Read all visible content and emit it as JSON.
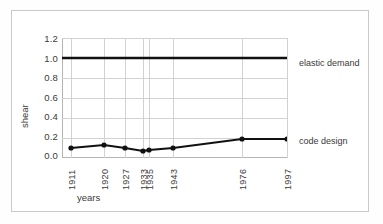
{
  "chart_data": {
    "type": "line",
    "title": "",
    "xlabel": "years",
    "ylabel": "shear",
    "categories": [
      "1911",
      "1920",
      "1927",
      "1933",
      "1935",
      "1943",
      "1976",
      "1997"
    ],
    "ylim": [
      0.0,
      1.3
    ],
    "yticks": [
      "1.2",
      "1.0",
      "0.8",
      "0.6",
      "0.4",
      "0.2",
      "0.0"
    ],
    "ytick_values": [
      1.2,
      1.0,
      0.8,
      0.6,
      0.4,
      0.2,
      0.0
    ],
    "grid": true,
    "legend_position": "right-inline-annotation",
    "series": [
      {
        "name": "elastic demand",
        "values": [
          1.0,
          1.0,
          1.0,
          1.0,
          1.0,
          1.0,
          1.0,
          1.0
        ],
        "markers": false,
        "color": "#111111",
        "label": "elastic demand"
      },
      {
        "name": "code design",
        "values": [
          0.1,
          0.13,
          0.1,
          0.07,
          0.08,
          0.1,
          0.19,
          0.19
        ],
        "markers": true,
        "color": "#111111",
        "label": "code design"
      }
    ],
    "annotations": [
      {
        "text": "elastic demand",
        "at_value": 1.0
      },
      {
        "text": "code design",
        "at_value": 0.19
      }
    ]
  }
}
